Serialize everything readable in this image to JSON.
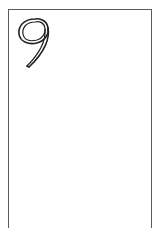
{
  "card": {
    "rank": "9",
    "border_color": "#5a5a5a",
    "glyph_color": "#222222",
    "background": "#ffffff"
  }
}
